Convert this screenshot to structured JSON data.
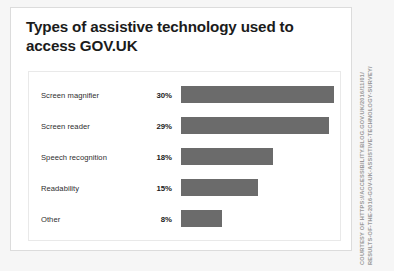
{
  "card": {
    "title": "Types of assistive technology used to access GOV.UK"
  },
  "credit": {
    "line1": "COURTESY OF HTTPS://ACCESSIBILITY.BLOG.GOV.UK/2016/11/01/",
    "line2": "RESULTS-OF-THE-2016-GOV-UK-ASSISTIVE-TECHNOLOGY-SURVEY/"
  },
  "colors": {
    "bar": "#6b6b6b",
    "card_background": "#ffffff",
    "page_background": "#f6f6f6",
    "title_text": "#1b1b1b",
    "label_text": "#2e2e2e",
    "credit_text": "#9a9a9a"
  },
  "chart_data": {
    "type": "bar",
    "orientation": "horizontal",
    "title": "Types of assistive technology used to access GOV.UK",
    "xlabel": "",
    "ylabel": "",
    "grid": false,
    "legend": false,
    "xlim": [
      0,
      30
    ],
    "categories": [
      "Screen magnifier",
      "Screen reader",
      "Speech recognition",
      "Readability",
      "Other"
    ],
    "values": [
      30,
      29,
      18,
      15,
      8
    ],
    "value_labels": [
      "30%",
      "29%",
      "18%",
      "15%",
      "8%"
    ]
  }
}
